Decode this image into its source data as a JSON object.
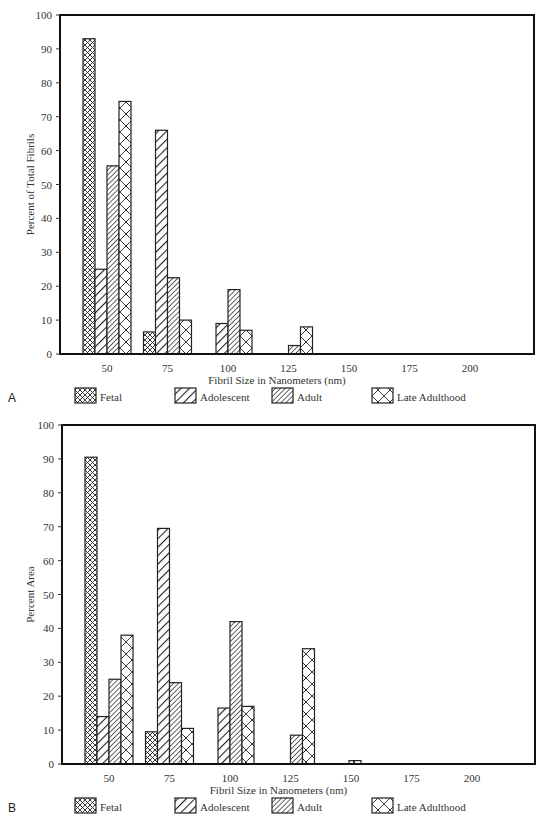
{
  "chart_data": [
    {
      "panel": "A",
      "type": "bar",
      "ylabel": "Percent of Total Fibrils",
      "xlabel": "Fibril Size in Nanometers (nm)",
      "ylim": [
        0,
        100
      ],
      "yticks": [
        0,
        10,
        20,
        30,
        40,
        50,
        60,
        70,
        80,
        90,
        100
      ],
      "xticks": [
        50,
        75,
        100,
        125,
        150,
        175,
        200
      ],
      "categories": [
        50,
        75,
        100,
        125,
        150
      ],
      "series": [
        {
          "name": "Fetal",
          "pattern": "fine-crosshatch",
          "values": [
            93,
            6.5,
            0,
            0,
            0
          ]
        },
        {
          "name": "Adolescent",
          "pattern": "wide-diagonal",
          "values": [
            25,
            66,
            9,
            0,
            0
          ]
        },
        {
          "name": "Adult",
          "pattern": "dense-diagonal",
          "values": [
            55.5,
            22.5,
            19,
            2.5,
            0
          ]
        },
        {
          "name": "Late Adulthood",
          "pattern": "large-crosshatch",
          "values": [
            74.5,
            10,
            7,
            8,
            0
          ]
        }
      ],
      "legend": [
        "Fetal",
        "Adolescent",
        "Adult",
        "Late Adulthood"
      ],
      "legend_position": "bottom",
      "grid": false
    },
    {
      "panel": "B",
      "type": "bar",
      "ylabel": "Percent Area",
      "xlabel": "Fibril Size in Nanometers (nm)",
      "ylim": [
        0,
        100
      ],
      "yticks": [
        0,
        10,
        20,
        30,
        40,
        50,
        60,
        70,
        80,
        90,
        100
      ],
      "xticks": [
        50,
        75,
        100,
        125,
        150,
        175,
        200
      ],
      "categories": [
        50,
        75,
        100,
        125,
        150
      ],
      "series": [
        {
          "name": "Fetal",
          "pattern": "fine-crosshatch",
          "values": [
            90.5,
            9.5,
            0,
            0,
            0
          ]
        },
        {
          "name": "Adolescent",
          "pattern": "wide-diagonal",
          "values": [
            14,
            69.5,
            16.5,
            0,
            0
          ]
        },
        {
          "name": "Adult",
          "pattern": "dense-diagonal",
          "values": [
            25,
            24,
            42,
            8.5,
            0
          ]
        },
        {
          "name": "Late Adulthood",
          "pattern": "large-crosshatch",
          "values": [
            38,
            10.5,
            17,
            34,
            1
          ]
        }
      ],
      "legend": [
        "Fetal",
        "Adolescent",
        "Adult",
        "Late Adulthood"
      ],
      "legend_position": "bottom",
      "grid": false
    }
  ]
}
